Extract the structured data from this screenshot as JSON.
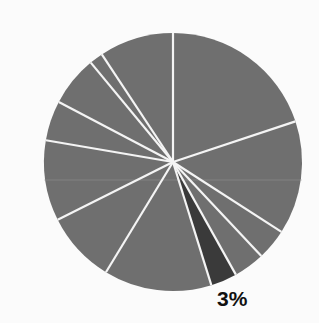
{
  "chart_data": {
    "type": "pie",
    "title": "",
    "start_angle_deg": 0,
    "direction": "clockwise",
    "center": [
      173,
      162
    ],
    "radius": 129,
    "colors": {
      "default_slice": "#6f6f6f",
      "highlight_slice": "#3a3a3a",
      "separator": "#f4f4f4",
      "label": "#111111"
    },
    "slices": [
      {
        "value": 19.9,
        "highlight": false,
        "label": ""
      },
      {
        "value": 14.2,
        "highlight": false,
        "label": ""
      },
      {
        "value": 3.9,
        "highlight": false,
        "label": ""
      },
      {
        "value": 3.9,
        "highlight": false,
        "label": ""
      },
      {
        "value": 3.3,
        "highlight": true,
        "label": "3%"
      },
      {
        "value": 13.5,
        "highlight": false,
        "label": ""
      },
      {
        "value": 8.9,
        "highlight": false,
        "label": ""
      },
      {
        "value": 10.1,
        "highlight": false,
        "label": ""
      },
      {
        "value": 5.0,
        "highlight": false,
        "label": ""
      },
      {
        "value": 6.3,
        "highlight": false,
        "label": ""
      },
      {
        "value": 1.7,
        "highlight": false,
        "label": ""
      },
      {
        "value": 9.3,
        "highlight": false,
        "label": ""
      }
    ],
    "annotations": [
      {
        "text": "3%",
        "x": 217,
        "y": 306
      }
    ],
    "legend": null
  }
}
